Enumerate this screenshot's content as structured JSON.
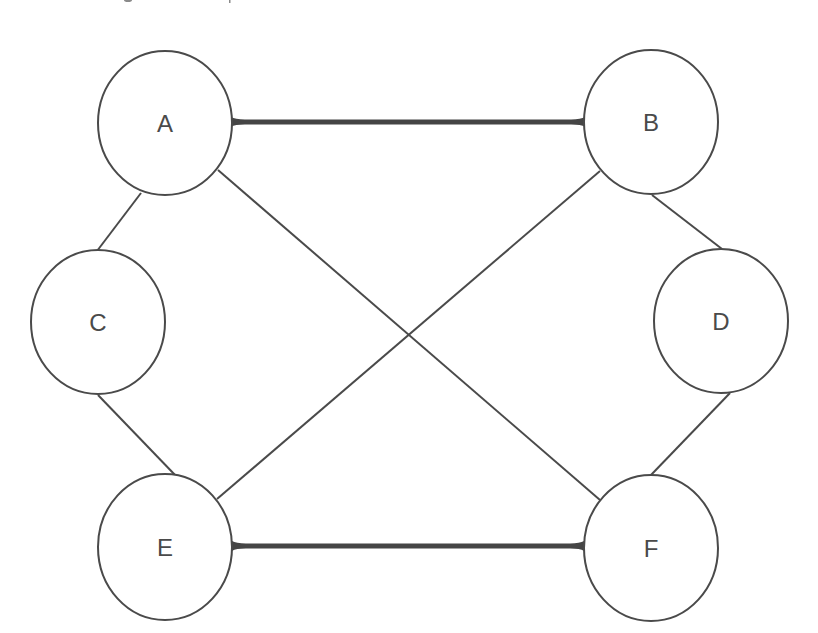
{
  "diagram": {
    "type": "graph",
    "colors": {
      "background": "#ffffff",
      "stroke": "#4a4a4a",
      "thick_edge": "#454545",
      "label": "#4a4a4a"
    },
    "nodes": [
      {
        "id": "A",
        "label": "A",
        "cx": 165,
        "cy": 123,
        "rx": 67,
        "ry": 72
      },
      {
        "id": "B",
        "label": "B",
        "cx": 651,
        "cy": 122,
        "rx": 67,
        "ry": 72
      },
      {
        "id": "C",
        "label": "C",
        "cx": 98,
        "cy": 322,
        "rx": 67,
        "ry": 72
      },
      {
        "id": "D",
        "label": "D",
        "cx": 721,
        "cy": 321,
        "rx": 67,
        "ry": 72
      },
      {
        "id": "E",
        "label": "E",
        "cx": 165,
        "cy": 547,
        "rx": 67,
        "ry": 73
      },
      {
        "id": "F",
        "label": "F",
        "cx": 651,
        "cy": 548,
        "rx": 67,
        "ry": 73
      }
    ],
    "edges": [
      {
        "from": "A",
        "to": "B",
        "weight": "thick",
        "x1": 231,
        "y1": 122,
        "x2": 585,
        "y2": 122
      },
      {
        "from": "E",
        "to": "F",
        "weight": "thick",
        "x1": 232,
        "y1": 546,
        "x2": 584,
        "y2": 546
      },
      {
        "from": "A",
        "to": "F",
        "weight": "thin",
        "x1": 218,
        "y1": 170,
        "x2": 600,
        "y2": 500
      },
      {
        "from": "B",
        "to": "E",
        "weight": "thin",
        "x1": 600,
        "y1": 171,
        "x2": 217,
        "y2": 499
      },
      {
        "from": "A",
        "to": "C",
        "weight": "thin",
        "x1": 141,
        "y1": 193,
        "x2": 97,
        "y2": 251
      },
      {
        "from": "C",
        "to": "E",
        "weight": "thin",
        "x1": 98,
        "y1": 395,
        "x2": 176,
        "y2": 476
      },
      {
        "from": "B",
        "to": "D",
        "weight": "thin",
        "x1": 652,
        "y1": 195,
        "x2": 722,
        "y2": 249
      },
      {
        "from": "D",
        "to": "F",
        "weight": "thin",
        "x1": 730,
        "y1": 393,
        "x2": 651,
        "y2": 475
      }
    ]
  }
}
